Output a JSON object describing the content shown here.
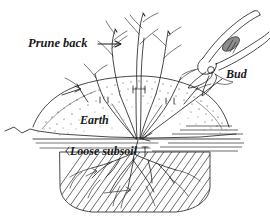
{
  "figure": {
    "background_color": "#ffffff",
    "ink_color": "#1a1a1a",
    "labels": {
      "prune_back": "Prune back",
      "earth": "Earth",
      "loose_subsoil": "Loose subsoil",
      "bud": "Bud"
    },
    "parts": {
      "mound": "earth-mound",
      "hole": "planting-hole",
      "roots": "root-system",
      "canes": "pruned-canes",
      "inset": "bud-detail-inset"
    },
    "annotations": [
      {
        "name": "prune-back-arrow",
        "points_to": "pruned-cane-tips"
      },
      {
        "name": "earth-mound-arrow",
        "points_to": "earth-mound-slope"
      },
      {
        "name": "bud-leader-line",
        "points_to": "plant-base"
      }
    ]
  }
}
